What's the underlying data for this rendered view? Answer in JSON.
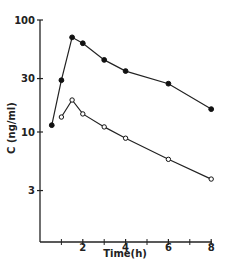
{
  "chart_data": {
    "type": "line",
    "title": "",
    "xlabel": "Time(h)",
    "ylabel": "C (ng/ml)",
    "yscale": "log",
    "xlim": [
      0,
      8
    ],
    "ylim": [
      1,
      100
    ],
    "x_ticks": [
      2,
      4,
      6,
      8
    ],
    "x_minor_ticks": [
      1,
      3,
      5,
      7
    ],
    "y_ticks": [
      100,
      30,
      10,
      3
    ],
    "grid": false,
    "legend": null,
    "series": [
      {
        "name": "filled-circles",
        "marker": "filled",
        "x": [
          0.55,
          1.0,
          1.5,
          2,
          3,
          4,
          6,
          8
        ],
        "values": [
          11.5,
          29,
          70,
          62,
          44,
          35,
          27,
          16
        ]
      },
      {
        "name": "open-circles",
        "marker": "open",
        "x": [
          1.0,
          1.5,
          2,
          3,
          4,
          6,
          8
        ],
        "values": [
          13.6,
          19.3,
          14.5,
          11.1,
          8.8,
          5.7,
          3.8
        ]
      }
    ]
  },
  "labels": {
    "xlabel": "Time(h)",
    "ylabel": "C (ng/ml)",
    "x_ticks": [
      "2",
      "4",
      "6",
      "8"
    ],
    "y_ticks": [
      "100",
      "30",
      "10",
      "3"
    ]
  }
}
